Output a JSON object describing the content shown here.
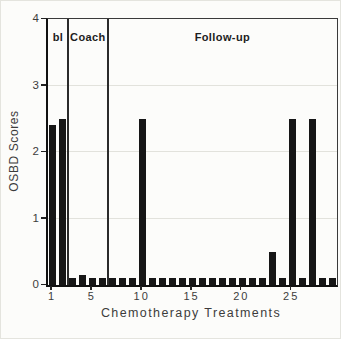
{
  "figure": {
    "background": "#fcfcfa"
  },
  "chart_data": {
    "type": "bar",
    "title": "",
    "xlabel": "Chemotherapy Treatments",
    "ylabel": "OSBD Scores",
    "ylim": [
      0,
      4
    ],
    "yticks": [
      0,
      1,
      2,
      3,
      4
    ],
    "xticks": [
      1,
      5,
      10,
      15,
      20,
      25
    ],
    "gridlines_y": [
      1,
      2,
      3
    ],
    "grid": "horizontal-light",
    "legend": "none",
    "bar_color": "#161616",
    "categories": [
      1,
      2,
      3,
      4,
      5,
      6,
      7,
      8,
      9,
      10,
      11,
      12,
      13,
      14,
      15,
      16,
      17,
      18,
      19,
      20,
      21,
      22,
      23,
      24,
      25,
      26,
      27,
      28,
      29
    ],
    "values": [
      2.4,
      2.5,
      0.1,
      0.15,
      0.1,
      0.1,
      0.1,
      0.1,
      0.1,
      2.5,
      0.1,
      0.1,
      0.1,
      0.1,
      0.1,
      0.1,
      0.1,
      0.1,
      0.1,
      0.1,
      0.1,
      0.1,
      0.5,
      0.1,
      2.5,
      0.1,
      2.5,
      0.1,
      0.1
    ],
    "sections": [
      {
        "label": "bl",
        "from": 1,
        "to": 2
      },
      {
        "label": "Coach",
        "from": 3,
        "to": 6
      },
      {
        "label": "Follow-up",
        "from": 7,
        "to": 29
      }
    ]
  }
}
